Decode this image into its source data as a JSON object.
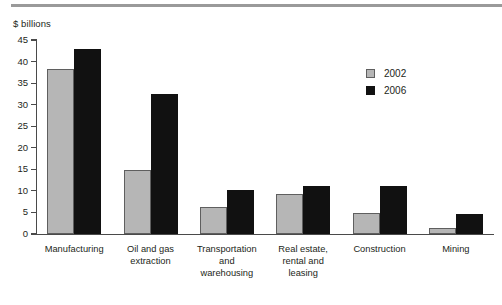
{
  "chart_data": {
    "type": "bar",
    "title": "",
    "subtitle": "",
    "xlabel": "",
    "ylabel": "$ billions",
    "ylim": [
      0,
      45
    ],
    "ytick_interval": 5,
    "yticks": [
      0,
      5,
      10,
      15,
      20,
      25,
      30,
      35,
      40,
      45
    ],
    "ytick_labels": [
      "0",
      "5",
      "10",
      "15",
      "20",
      "25",
      "30",
      "35",
      "40",
      "45"
    ],
    "grid": false,
    "legend_position": "upper-right-inside",
    "categories": [
      "Manufacturing",
      "Oil and gas extraction",
      "Transportation and warehousing",
      "Real estate, rental and leasing",
      "Construction",
      "Mining"
    ],
    "category_label_lines": [
      [
        "Manufacturing"
      ],
      [
        "Oil and gas",
        "extraction"
      ],
      [
        "Transportation",
        "and",
        "warehousing"
      ],
      [
        "Real estate,",
        "rental and",
        "leasing"
      ],
      [
        "Construction"
      ],
      [
        "Mining"
      ]
    ],
    "series": [
      {
        "name": "2002",
        "color": "#b6b6b6",
        "values": [
          38.2,
          14.8,
          6.3,
          9.2,
          4.9,
          1.5
        ]
      },
      {
        "name": "2006",
        "color": "#111111",
        "values": [
          42.8,
          32.4,
          10.2,
          11.1,
          11.1,
          4.6
        ]
      }
    ]
  },
  "legend": {
    "entries": [
      {
        "label": "2002"
      },
      {
        "label": "2006"
      }
    ]
  },
  "colors": {
    "series_2002": "#b6b6b6",
    "series_2002_border": "#5f5f5f",
    "series_2006": "#111111",
    "axis": "#4a4a4a",
    "top_rule": "#9a9a9a",
    "text": "#231f20",
    "background": "#ffffff"
  }
}
